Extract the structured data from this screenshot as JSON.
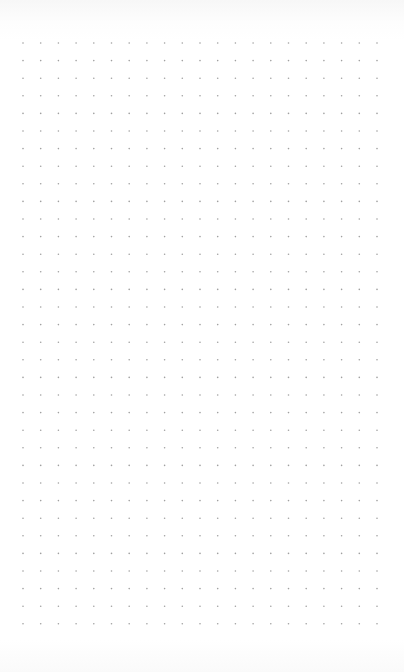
{
  "canvas": {
    "type": "dot-grid-page",
    "background_color": "#ffffff",
    "dot_color": "#a0a0a0",
    "dot_radius": 0.8,
    "grid": {
      "columns": 21,
      "rows": 34,
      "origin_x": 23,
      "origin_y": 43,
      "spacing_x": 17.7,
      "spacing_y": 17.6
    }
  }
}
